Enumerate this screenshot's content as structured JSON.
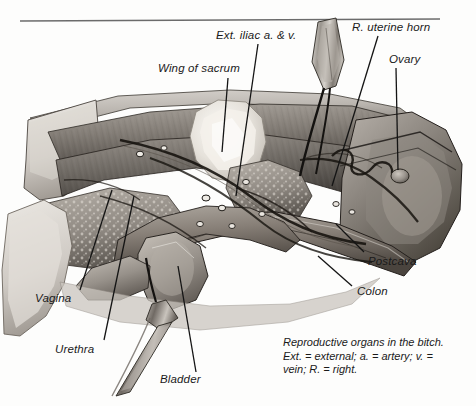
{
  "figure": {
    "title": "Reproductive organs in the bitch",
    "medium": "grayscale anatomical illustration",
    "rule_color": "#6b6b6b",
    "label_color": "#1a1a1a",
    "leader_color": "#141414"
  },
  "labels": [
    {
      "id": "ext-iliac",
      "text": "Ext. iliac a. & v.",
      "x": 216,
      "y": 35,
      "anchor": "start"
    },
    {
      "id": "uterine-horn",
      "text": "R. uterine horn",
      "x": 352,
      "y": 27,
      "anchor": "start"
    },
    {
      "id": "wing-sacrum",
      "text": "Wing of sacrum",
      "x": 158,
      "y": 68,
      "anchor": "start"
    },
    {
      "id": "ovary",
      "text": "Ovary",
      "x": 389,
      "y": 59,
      "anchor": "start"
    },
    {
      "id": "postcava",
      "text": "Postcava",
      "x": 368,
      "y": 261,
      "anchor": "start"
    },
    {
      "id": "colon",
      "text": "Colon",
      "x": 357,
      "y": 291,
      "anchor": "start"
    },
    {
      "id": "vagina",
      "text": "Vagina",
      "x": 35,
      "y": 298,
      "anchor": "start"
    },
    {
      "id": "urethra",
      "text": "Urethra",
      "x": 55,
      "y": 349,
      "anchor": "start"
    },
    {
      "id": "bladder",
      "text": "Bladder",
      "x": 160,
      "y": 379,
      "anchor": "start"
    }
  ],
  "caption": {
    "line1": "Reproductive organs in the bitch.",
    "line2": "Ext. = external; a. = artery; v. =",
    "line3": "vein; R. = right."
  }
}
